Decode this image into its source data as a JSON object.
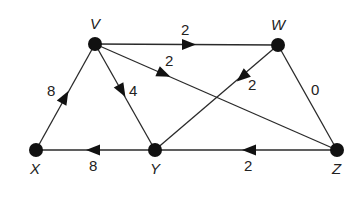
{
  "graph": {
    "nodes": [
      {
        "id": "V",
        "label": "V",
        "x": 95,
        "y": 44
      },
      {
        "id": "W",
        "label": "W",
        "x": 278,
        "y": 45
      },
      {
        "id": "X",
        "label": "X",
        "x": 36,
        "y": 150
      },
      {
        "id": "Y",
        "label": "Y",
        "x": 155,
        "y": 150
      },
      {
        "id": "Z",
        "label": "Z",
        "x": 337,
        "y": 150
      }
    ],
    "edges": [
      {
        "from": "V",
        "to": "W",
        "weight": "2",
        "directed": true
      },
      {
        "from": "V",
        "to": "Z",
        "weight": "2",
        "directed": true
      },
      {
        "from": "V",
        "to": "Y",
        "weight": "4",
        "directed": true
      },
      {
        "from": "X",
        "to": "V",
        "weight": "8",
        "directed": true
      },
      {
        "from": "W",
        "to": "Y",
        "weight": "2",
        "directed": true
      },
      {
        "from": "W",
        "to": "Z",
        "weight": "0",
        "directed": false
      },
      {
        "from": "Y",
        "to": "X",
        "weight": "8",
        "directed": true
      },
      {
        "from": "Z",
        "to": "Y",
        "weight": "2",
        "directed": true
      }
    ]
  }
}
